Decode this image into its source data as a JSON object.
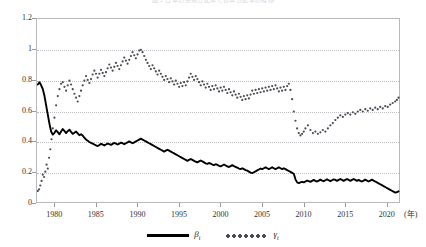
{
  "figure": {
    "title": "図 2 日本の労働分配率と資本分配率の推移",
    "background": "#ffffff"
  },
  "axes": {
    "y_ticks": [
      "0",
      "0.2",
      "0.4",
      "0.6",
      "0.8",
      "1",
      "1.2"
    ],
    "x_ticks": [
      "1980",
      "1985",
      "1990",
      "1995",
      "2000",
      "2005",
      "2010",
      "2015",
      "2020"
    ],
    "x_unit_label": "(年)",
    "grid": "dotted-horizontal",
    "frame_color": "#b9b9bd",
    "grid_color": "#bdbdc2"
  },
  "legend": {
    "position": "below-plot",
    "items": [
      {
        "name": "beta",
        "label": "β",
        "sub": "t",
        "style": "solid-line",
        "color": "#000000"
      },
      {
        "name": "gamma",
        "label": "γ",
        "sub": "t",
        "style": "dotted-markers",
        "color": "#4a4a52"
      }
    ]
  },
  "chart_data": {
    "type": "line",
    "title": "図 2 日本の労働分配率と資本分配率の推移",
    "xlabel": "(年)",
    "ylabel": "",
    "xlim": [
      1977.8,
      2021.6
    ],
    "ylim": [
      0,
      1.2
    ],
    "yticks": [
      0,
      0.2,
      0.4,
      0.6,
      0.8,
      1.0,
      1.2
    ],
    "xticks": [
      1980,
      1985,
      1990,
      1995,
      2000,
      2005,
      2010,
      2015,
      2020
    ],
    "grid": true,
    "legend_position": "bottom-center",
    "series": [
      {
        "name": "β_t",
        "label": "β",
        "style": "solid",
        "color": "#000000",
        "x": [
          1977.9,
          1978.1,
          1978.3,
          1978.5,
          1978.7,
          1978.9,
          1979.1,
          1979.3,
          1979.5,
          1979.7,
          1979.9,
          1980.1,
          1980.3,
          1980.5,
          1980.7,
          1980.9,
          1981.1,
          1981.3,
          1981.5,
          1981.7,
          1981.9,
          1982.1,
          1982.3,
          1982.5,
          1982.7,
          1982.9,
          1983.1,
          1983.3,
          1983.5,
          1983.7,
          1983.9,
          1984.1,
          1984.3,
          1984.5,
          1984.7,
          1984.9,
          1985.1,
          1985.3,
          1985.5,
          1985.7,
          1985.9,
          1986.1,
          1986.3,
          1986.5,
          1986.7,
          1986.9,
          1987.1,
          1987.3,
          1987.5,
          1987.7,
          1987.9,
          1988.1,
          1988.3,
          1988.5,
          1988.7,
          1988.9,
          1989.1,
          1989.3,
          1989.5,
          1989.7,
          1989.9,
          1990.1,
          1990.3,
          1990.5,
          1990.7,
          1990.9,
          1991.1,
          1991.3,
          1991.5,
          1991.7,
          1991.9,
          1992.1,
          1992.3,
          1992.5,
          1992.7,
          1992.9,
          1993.1,
          1993.3,
          1993.5,
          1993.7,
          1993.9,
          1994.1,
          1994.3,
          1994.5,
          1994.7,
          1994.9,
          1995.1,
          1995.3,
          1995.5,
          1995.7,
          1995.9,
          1996.1,
          1996.3,
          1996.5,
          1996.7,
          1996.9,
          1997.1,
          1997.3,
          1997.5,
          1997.7,
          1997.9,
          1998.1,
          1998.3,
          1998.5,
          1998.7,
          1998.9,
          1999.1,
          1999.3,
          1999.5,
          1999.7,
          1999.9,
          2000.1,
          2000.3,
          2000.5,
          2000.7,
          2000.9,
          2001.1,
          2001.3,
          2001.5,
          2001.7,
          2001.9,
          2002.1,
          2002.3,
          2002.5,
          2002.7,
          2002.9,
          2003.1,
          2003.3,
          2003.5,
          2003.7,
          2003.9,
          2004.1,
          2004.3,
          2004.5,
          2004.7,
          2004.9,
          2005.1,
          2005.3,
          2005.5,
          2005.7,
          2005.9,
          2006.1,
          2006.3,
          2006.5,
          2006.7,
          2006.9,
          2007.1,
          2007.3,
          2007.5,
          2007.7,
          2007.9,
          2008.1,
          2008.3,
          2008.5,
          2008.7,
          2008.9,
          2009.1,
          2009.3,
          2009.5,
          2009.7,
          2009.9,
          2010.1,
          2010.3,
          2010.5,
          2010.7,
          2010.9,
          2011.1,
          2011.3,
          2011.5,
          2011.7,
          2011.9,
          2012.1,
          2012.3,
          2012.5,
          2012.7,
          2012.9,
          2013.1,
          2013.3,
          2013.5,
          2013.7,
          2013.9,
          2014.1,
          2014.3,
          2014.5,
          2014.7,
          2014.9,
          2015.1,
          2015.3,
          2015.5,
          2015.7,
          2015.9,
          2016.1,
          2016.3,
          2016.5,
          2016.7,
          2016.9,
          2017.1,
          2017.3,
          2017.5,
          2017.7,
          2017.9,
          2018.1,
          2018.3,
          2018.5,
          2018.7,
          2018.9,
          2019.1,
          2019.3,
          2019.5,
          2019.7,
          2019.9,
          2020.1,
          2020.3,
          2020.5,
          2020.7,
          2020.9,
          2021.1,
          2021.3
        ],
        "y": [
          0.775,
          0.79,
          0.77,
          0.745,
          0.7,
          0.64,
          0.58,
          0.52,
          0.47,
          0.45,
          0.462,
          0.478,
          0.466,
          0.452,
          0.47,
          0.486,
          0.474,
          0.46,
          0.472,
          0.482,
          0.468,
          0.455,
          0.462,
          0.47,
          0.458,
          0.446,
          0.452,
          0.444,
          0.43,
          0.418,
          0.41,
          0.402,
          0.396,
          0.392,
          0.386,
          0.38,
          0.376,
          0.382,
          0.39,
          0.386,
          0.38,
          0.386,
          0.392,
          0.388,
          0.384,
          0.39,
          0.396,
          0.392,
          0.386,
          0.392,
          0.398,
          0.394,
          0.388,
          0.394,
          0.4,
          0.406,
          0.4,
          0.394,
          0.4,
          0.406,
          0.412,
          0.418,
          0.424,
          0.418,
          0.412,
          0.406,
          0.4,
          0.394,
          0.388,
          0.382,
          0.376,
          0.37,
          0.364,
          0.358,
          0.352,
          0.346,
          0.34,
          0.346,
          0.352,
          0.346,
          0.34,
          0.334,
          0.328,
          0.322,
          0.316,
          0.31,
          0.304,
          0.298,
          0.292,
          0.286,
          0.28,
          0.286,
          0.292,
          0.286,
          0.28,
          0.274,
          0.27,
          0.276,
          0.282,
          0.276,
          0.27,
          0.264,
          0.26,
          0.266,
          0.262,
          0.256,
          0.252,
          0.258,
          0.254,
          0.248,
          0.244,
          0.25,
          0.256,
          0.25,
          0.244,
          0.24,
          0.246,
          0.252,
          0.246,
          0.24,
          0.236,
          0.23,
          0.226,
          0.232,
          0.226,
          0.22,
          0.216,
          0.21,
          0.204,
          0.2,
          0.206,
          0.212,
          0.218,
          0.224,
          0.23,
          0.226,
          0.232,
          0.238,
          0.232,
          0.226,
          0.232,
          0.238,
          0.232,
          0.226,
          0.232,
          0.238,
          0.232,
          0.226,
          0.232,
          0.226,
          0.22,
          0.214,
          0.208,
          0.202,
          0.196,
          0.16,
          0.14,
          0.136,
          0.14,
          0.144,
          0.14,
          0.146,
          0.152,
          0.148,
          0.144,
          0.15,
          0.156,
          0.15,
          0.146,
          0.152,
          0.158,
          0.152,
          0.148,
          0.154,
          0.16,
          0.154,
          0.148,
          0.154,
          0.16,
          0.156,
          0.15,
          0.156,
          0.162,
          0.156,
          0.15,
          0.156,
          0.162,
          0.156,
          0.15,
          0.156,
          0.162,
          0.156,
          0.15,
          0.156,
          0.15,
          0.146,
          0.152,
          0.158,
          0.152,
          0.146,
          0.152,
          0.158,
          0.152,
          0.146,
          0.14,
          0.134,
          0.128,
          0.122,
          0.116,
          0.11,
          0.104,
          0.098,
          0.092,
          0.086,
          0.08,
          0.074,
          0.076,
          0.082
        ]
      },
      {
        "name": "γ_t",
        "label": "γ",
        "style": "dotted",
        "color": "#4a4a52",
        "x": [
          1977.9,
          1978.05,
          1978.2,
          1978.35,
          1978.5,
          1978.65,
          1978.8,
          1978.95,
          1979.1,
          1979.25,
          1979.4,
          1979.55,
          1979.7,
          1979.9,
          1980.1,
          1980.3,
          1980.5,
          1980.7,
          1980.9,
          1981.1,
          1981.3,
          1981.5,
          1981.7,
          1981.9,
          1982.1,
          1982.3,
          1982.5,
          1982.7,
          1982.9,
          1983.1,
          1983.3,
          1983.5,
          1983.7,
          1983.9,
          1984.1,
          1984.3,
          1984.5,
          1984.7,
          1984.9,
          1985.1,
          1985.3,
          1985.5,
          1985.7,
          1985.9,
          1986.1,
          1986.3,
          1986.5,
          1986.7,
          1986.9,
          1987.1,
          1987.3,
          1987.5,
          1987.7,
          1987.9,
          1988.1,
          1988.3,
          1988.5,
          1988.7,
          1988.9,
          1989.1,
          1989.3,
          1989.5,
          1989.7,
          1989.9,
          1990.1,
          1990.3,
          1990.5,
          1990.7,
          1990.9,
          1991.1,
          1991.3,
          1991.5,
          1991.7,
          1991.9,
          1992.1,
          1992.3,
          1992.5,
          1992.7,
          1992.9,
          1993.1,
          1993.3,
          1993.5,
          1993.7,
          1993.9,
          1994.1,
          1994.3,
          1994.5,
          1994.7,
          1994.9,
          1995.1,
          1995.3,
          1995.5,
          1995.7,
          1995.9,
          1996.1,
          1996.3,
          1996.5,
          1996.7,
          1996.9,
          1997.1,
          1997.3,
          1997.5,
          1997.7,
          1997.9,
          1998.1,
          1998.3,
          1998.5,
          1998.7,
          1998.9,
          1999.1,
          1999.3,
          1999.5,
          1999.7,
          1999.9,
          2000.1,
          2000.3,
          2000.5,
          2000.7,
          2000.9,
          2001.1,
          2001.3,
          2001.5,
          2001.7,
          2001.9,
          2002.1,
          2002.3,
          2002.5,
          2002.7,
          2002.9,
          2003.1,
          2003.3,
          2003.5,
          2003.7,
          2003.9,
          2004.1,
          2004.3,
          2004.5,
          2004.7,
          2004.9,
          2005.1,
          2005.3,
          2005.5,
          2005.7,
          2005.9,
          2006.1,
          2006.3,
          2006.5,
          2006.7,
          2006.9,
          2007.1,
          2007.3,
          2007.5,
          2007.7,
          2007.9,
          2008.1,
          2008.3,
          2008.5,
          2008.7,
          2008.9,
          2009.1,
          2009.3,
          2009.5,
          2009.7,
          2009.9,
          2010.1,
          2010.4,
          2010.7,
          2011.0,
          2011.3,
          2011.6,
          2011.9,
          2012.2,
          2012.5,
          2012.8,
          2013.1,
          2013.4,
          2013.7,
          2014.0,
          2014.3,
          2014.6,
          2014.9,
          2015.2,
          2015.5,
          2015.8,
          2016.1,
          2016.4,
          2016.7,
          2017.0,
          2017.3,
          2017.6,
          2017.9,
          2018.2,
          2018.5,
          2018.8,
          2019.1,
          2019.4,
          2019.7,
          2020.0,
          2020.3,
          2020.6,
          2020.9,
          2021.1,
          2021.3
        ],
        "y": [
          0.085,
          0.095,
          0.12,
          0.15,
          0.19,
          0.175,
          0.21,
          0.255,
          0.23,
          0.3,
          0.355,
          0.42,
          0.49,
          0.56,
          0.64,
          0.7,
          0.745,
          0.78,
          0.79,
          0.76,
          0.735,
          0.77,
          0.8,
          0.775,
          0.745,
          0.715,
          0.69,
          0.665,
          0.7,
          0.735,
          0.77,
          0.8,
          0.83,
          0.805,
          0.785,
          0.81,
          0.84,
          0.865,
          0.845,
          0.82,
          0.845,
          0.87,
          0.85,
          0.83,
          0.855,
          0.88,
          0.905,
          0.885,
          0.865,
          0.89,
          0.915,
          0.895,
          0.875,
          0.9,
          0.925,
          0.95,
          0.93,
          0.91,
          0.935,
          0.96,
          0.985,
          0.965,
          0.945,
          0.97,
          0.995,
          1.0,
          0.985,
          0.96,
          0.935,
          0.915,
          0.895,
          0.875,
          0.9,
          0.88,
          0.86,
          0.84,
          0.865,
          0.845,
          0.825,
          0.805,
          0.83,
          0.81,
          0.79,
          0.815,
          0.795,
          0.775,
          0.8,
          0.78,
          0.76,
          0.785,
          0.765,
          0.79,
          0.77,
          0.795,
          0.82,
          0.845,
          0.825,
          0.805,
          0.83,
          0.81,
          0.79,
          0.77,
          0.795,
          0.775,
          0.755,
          0.78,
          0.76,
          0.74,
          0.765,
          0.745,
          0.77,
          0.75,
          0.73,
          0.755,
          0.735,
          0.76,
          0.74,
          0.72,
          0.745,
          0.725,
          0.705,
          0.73,
          0.71,
          0.69,
          0.715,
          0.695,
          0.675,
          0.7,
          0.68,
          0.705,
          0.685,
          0.71,
          0.735,
          0.715,
          0.74,
          0.72,
          0.745,
          0.725,
          0.75,
          0.73,
          0.755,
          0.735,
          0.76,
          0.74,
          0.765,
          0.745,
          0.77,
          0.75,
          0.73,
          0.755,
          0.735,
          0.76,
          0.74,
          0.765,
          0.78,
          0.74,
          0.68,
          0.6,
          0.54,
          0.49,
          0.46,
          0.445,
          0.455,
          0.47,
          0.49,
          0.51,
          0.48,
          0.46,
          0.47,
          0.455,
          0.465,
          0.48,
          0.47,
          0.49,
          0.51,
          0.525,
          0.545,
          0.56,
          0.575,
          0.565,
          0.58,
          0.59,
          0.58,
          0.595,
          0.585,
          0.6,
          0.61,
          0.6,
          0.615,
          0.605,
          0.62,
          0.61,
          0.625,
          0.615,
          0.63,
          0.62,
          0.635,
          0.63,
          0.645,
          0.655,
          0.665,
          0.675,
          0.69
        ]
      }
    ]
  }
}
